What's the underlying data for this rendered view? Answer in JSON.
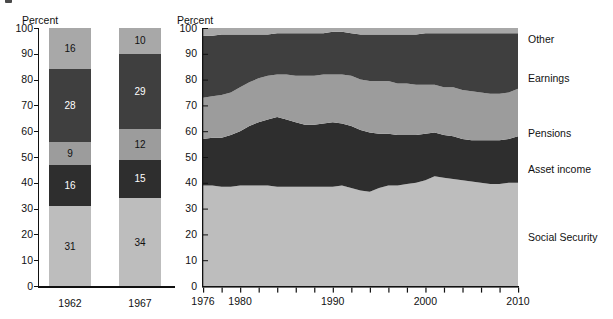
{
  "figure": {
    "marker": "figure-bullet"
  },
  "bar_panel": {
    "axis_title": "Percent",
    "y_ticks": [
      "100",
      "90",
      "80",
      "70",
      "60",
      "50",
      "40",
      "30",
      "20",
      "10",
      "0"
    ],
    "y_tick_values": [
      100,
      90,
      80,
      70,
      60,
      50,
      40,
      30,
      20,
      10,
      0
    ],
    "categories": [
      "1962",
      "1967"
    ],
    "bars": [
      {
        "category": "1962",
        "segments": [
          {
            "label": "Social Security",
            "value": 31,
            "color": "#bdbdbd",
            "text_color": "light"
          },
          {
            "label": "Asset income",
            "value": 16,
            "color": "#2e2e2e",
            "text_color": "dark"
          },
          {
            "label": "Pensions",
            "value": 9,
            "color": "#9c9c9c",
            "text_color": "light"
          },
          {
            "label": "Earnings",
            "value": 28,
            "color": "#3f3f3f",
            "text_color": "dark"
          },
          {
            "label": "Other",
            "value": 16,
            "color": "#a8a8a8",
            "text_color": "light"
          }
        ]
      },
      {
        "category": "1967",
        "segments": [
          {
            "label": "Social Security",
            "value": 34,
            "color": "#bdbdbd",
            "text_color": "light"
          },
          {
            "label": "Asset income",
            "value": 15,
            "color": "#2e2e2e",
            "text_color": "dark"
          },
          {
            "label": "Pensions",
            "value": 12,
            "color": "#9c9c9c",
            "text_color": "light"
          },
          {
            "label": "Earnings",
            "value": 29,
            "color": "#3f3f3f",
            "text_color": "dark"
          },
          {
            "label": "Other",
            "value": 10,
            "color": "#a8a8a8",
            "text_color": "light"
          }
        ]
      }
    ]
  },
  "area_panel": {
    "axis_title": "Percent",
    "y_ticks": [
      "100",
      "90",
      "80",
      "70",
      "60",
      "50",
      "40",
      "30",
      "20",
      "10",
      "0"
    ],
    "x_tick_labels": [
      "1976",
      "1980",
      "1990",
      "2000",
      "2010"
    ],
    "legend": [
      "Other",
      "Earnings",
      "Pensions",
      "Asset income",
      "Social Security"
    ]
  },
  "colors": {
    "social_security": "#bdbdbd",
    "asset_income": "#2e2e2e",
    "pensions": "#9c9c9c",
    "earnings": "#3f3f3f",
    "other": "#a8a8a8",
    "axis": "#111111",
    "background": "#ffffff"
  },
  "chart_data": [
    {
      "type": "bar",
      "title": "",
      "subtype": "stacked-100",
      "xlabel": "",
      "ylabel": "Percent",
      "ylim": [
        0,
        100
      ],
      "grid": false,
      "legend_position": "none",
      "categories": [
        "1962",
        "1967"
      ],
      "series": [
        {
          "name": "Social Security",
          "values": [
            31,
            34
          ],
          "color": "#bdbdbd"
        },
        {
          "name": "Asset income",
          "values": [
            16,
            15
          ],
          "color": "#2e2e2e"
        },
        {
          "name": "Pensions",
          "values": [
            9,
            12
          ],
          "color": "#9c9c9c"
        },
        {
          "name": "Earnings",
          "values": [
            28,
            29
          ],
          "color": "#3f3f3f"
        },
        {
          "name": "Other",
          "values": [
            16,
            10
          ],
          "color": "#a8a8a8"
        }
      ]
    },
    {
      "type": "area",
      "subtype": "stacked-100",
      "title": "",
      "xlabel": "",
      "ylabel": "Percent",
      "ylim": [
        0,
        100
      ],
      "xlim": [
        1976,
        2010
      ],
      "grid": false,
      "legend_position": "right",
      "x": [
        1976,
        1977,
        1978,
        1979,
        1980,
        1981,
        1982,
        1983,
        1984,
        1985,
        1986,
        1987,
        1988,
        1989,
        1990,
        1991,
        1992,
        1993,
        1994,
        1995,
        1996,
        1997,
        1998,
        1999,
        2000,
        2001,
        2002,
        2003,
        2004,
        2005,
        2006,
        2007,
        2008,
        2009,
        2010
      ],
      "series": [
        {
          "name": "Social Security",
          "color": "#bdbdbd",
          "values": [
            39,
            39,
            38.5,
            38.5,
            39,
            39,
            39,
            39,
            38.5,
            38.5,
            38.5,
            38.5,
            38.5,
            38.5,
            38.5,
            39,
            38,
            37,
            36.5,
            38,
            39,
            39,
            39.5,
            40,
            41,
            42.5,
            42,
            41.5,
            41,
            40.5,
            40,
            39.5,
            39.5,
            40,
            40
          ]
        },
        {
          "name": "Asset income",
          "color": "#2e2e2e",
          "values": [
            18,
            18.5,
            19,
            20,
            21,
            23,
            24.5,
            25.5,
            27,
            26,
            25,
            24,
            24,
            24.5,
            25,
            24,
            24,
            23.5,
            23,
            21,
            20,
            19.5,
            19,
            18.5,
            18,
            17,
            16.5,
            16.5,
            16,
            16,
            16.5,
            17,
            17,
            17,
            18
          ]
        },
        {
          "name": "Pensions",
          "color": "#9c9c9c",
          "values": [
            16,
            16,
            16.5,
            16.5,
            17,
            17,
            17,
            17,
            16.5,
            17.5,
            18,
            19,
            19,
            19,
            18.5,
            19,
            19.5,
            19.5,
            20,
            20.5,
            20.5,
            20,
            20,
            19.5,
            19,
            18.5,
            18.5,
            19,
            19,
            19,
            18.5,
            18,
            18,
            18,
            18.5
          ]
        },
        {
          "name": "Earnings",
          "color": "#3f3f3f",
          "values": [
            24,
            23.5,
            23.5,
            22.5,
            20.5,
            18.5,
            17,
            16,
            16,
            16,
            16.5,
            16.5,
            16.5,
            16,
            16.5,
            16.5,
            16.5,
            17.5,
            18,
            18,
            18,
            19,
            19,
            19.5,
            20,
            20,
            21,
            21,
            22,
            22.5,
            23,
            23.5,
            23.5,
            23,
            21.5
          ]
        },
        {
          "name": "Other",
          "color": "#a8a8a8",
          "values": [
            3,
            3,
            2.5,
            2.5,
            2.5,
            2.5,
            2.5,
            2.5,
            2,
            2,
            2,
            2,
            2,
            2,
            1.5,
            1.5,
            2,
            2.5,
            2.5,
            2.5,
            2.5,
            2.5,
            2.5,
            2.5,
            2,
            2,
            2,
            2,
            2,
            2,
            2,
            2,
            2,
            2,
            2
          ]
        }
      ]
    }
  ]
}
